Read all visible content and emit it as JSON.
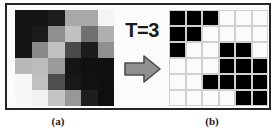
{
  "figure": {
    "caption_a": "(a)",
    "caption_b": "(b)",
    "threshold_label": "T=3",
    "arrow_icon": "right-arrow-icon",
    "arrow_color": "#8a8a8a",
    "frame_color": "#252525"
  },
  "grayscale_image": {
    "name": "grayscale-input-grid",
    "rows": 6,
    "cols": 6,
    "cells": [
      [
        "#141414",
        "#141414",
        "#1d1d1d",
        "#a8a8a8",
        "#a8a8a8",
        "#f4f4f4"
      ],
      [
        "#141414",
        "#1a1a1a",
        "#8f8f8f",
        "#c2c2c2",
        "#707070",
        "#b0b0b0"
      ],
      [
        "#151515",
        "#8a8a8a",
        "#c0c0c0",
        "#4a4a4a",
        "#1c1c1c",
        "#909090"
      ],
      [
        "#b8b8b8",
        "#bcbcbc",
        "#9a9a9a",
        "#151515",
        "#101010",
        "#101010"
      ],
      [
        "#f6f6f6",
        "#c0c0c0",
        "#4e4e4e",
        "#181818",
        "#121212",
        "#101010"
      ],
      [
        "#f8f8f8",
        "#f2f2f2",
        "#c4c4c4",
        "#989898",
        "#1e1e1e",
        "#0f0f0f"
      ]
    ]
  },
  "binary_image": {
    "name": "binary-output-grid",
    "rows": 6,
    "cols": 6,
    "on_color": "#000000",
    "off_color": "#fbfbfb",
    "cells": [
      [
        1,
        1,
        1,
        0,
        0,
        0
      ],
      [
        1,
        1,
        0,
        0,
        0,
        0
      ],
      [
        1,
        0,
        0,
        1,
        1,
        0
      ],
      [
        0,
        0,
        0,
        1,
        1,
        1
      ],
      [
        0,
        0,
        1,
        1,
        1,
        1
      ],
      [
        0,
        0,
        0,
        0,
        1,
        1
      ]
    ]
  }
}
